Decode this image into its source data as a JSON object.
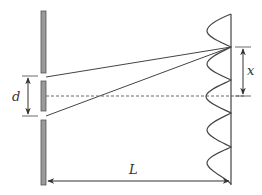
{
  "diagram": {
    "labels": {
      "slit_separation": "d",
      "fringe_distance": "x",
      "screen_distance": "L"
    },
    "colors": {
      "barrier_fill": "#9a9a9a",
      "barrier_stroke": "#555555",
      "line": "#444444",
      "dashed": "#666666"
    }
  }
}
